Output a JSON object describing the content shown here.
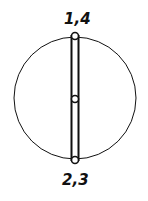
{
  "diagram": {
    "top_label": "1,4",
    "bottom_label": "2,3",
    "stroke_color": "#111111",
    "background": "#ffffff"
  }
}
